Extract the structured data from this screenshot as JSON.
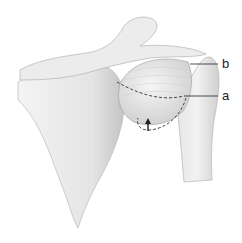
{
  "figure": {
    "labels": [
      {
        "id": "b",
        "text": "b"
      },
      {
        "id": "a",
        "text": "a"
      }
    ],
    "colors": {
      "bone_fill": "#ebebeb",
      "bone_shade": "#c8c8c8",
      "outline": "#9a9a9a",
      "dash_line": "#333333",
      "label_line": "#222222",
      "background": "#ffffff"
    }
  }
}
